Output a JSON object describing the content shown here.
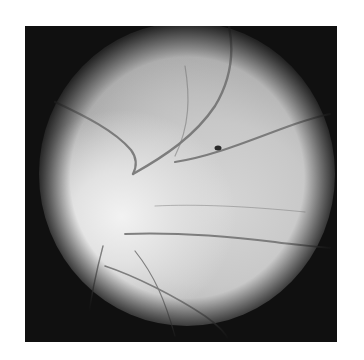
{
  "image": {
    "subject": "retinal fundus photograph (grayscale)",
    "background_color": "#ffffff",
    "frame_color": "#101010",
    "features": {
      "optic_disc": "bright region, lower-left",
      "vessels": "dark curving vessels radiating from optic disc",
      "dark_spot": "small dark spot, upper-right of center"
    }
  }
}
